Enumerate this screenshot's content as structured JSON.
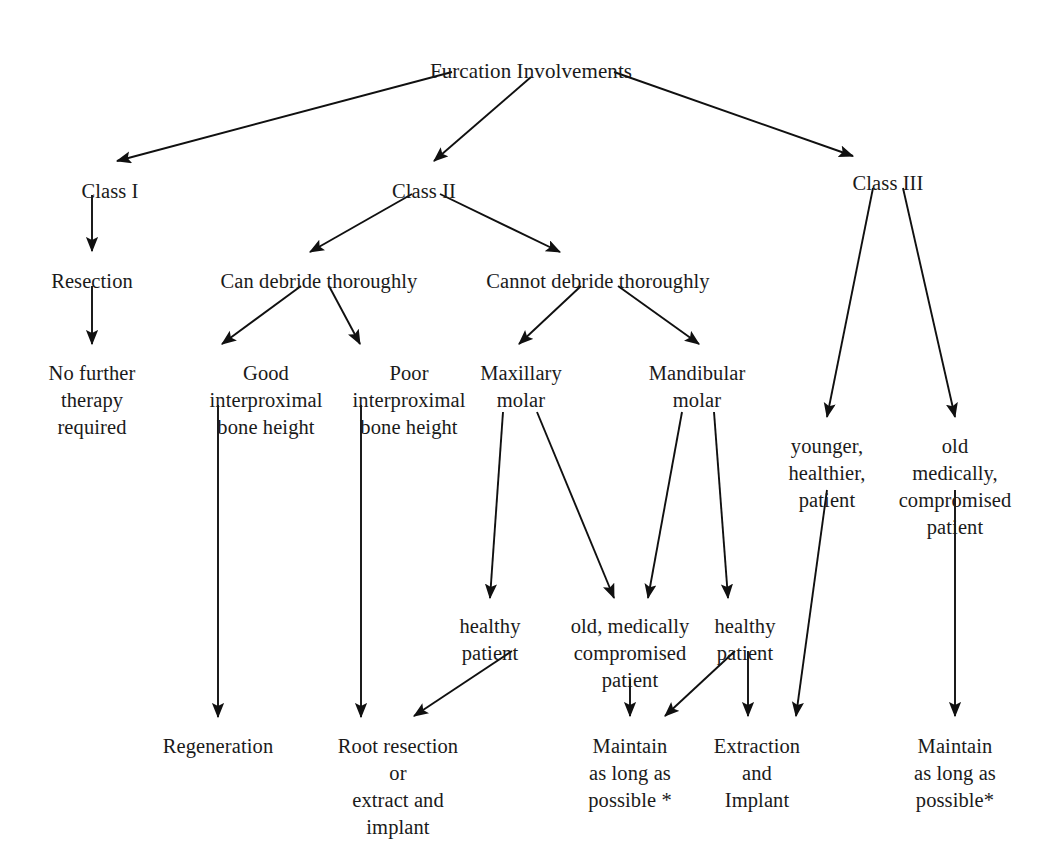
{
  "diagram": {
    "title": "Furcation Involvements",
    "type": "flowchart",
    "background_color": "#ffffff",
    "text_color": "#1a1a1a",
    "edge_color": "#101010",
    "nodes": [
      {
        "id": "root",
        "label": "Furcation Involvements",
        "x": 531,
        "y": 58,
        "level": 0
      },
      {
        "id": "class1",
        "label": "Class I",
        "x": 110,
        "y": 178,
        "level": 1
      },
      {
        "id": "class2",
        "label": "Class II",
        "x": 424,
        "y": 178,
        "level": 1
      },
      {
        "id": "class3",
        "label": "Class III",
        "x": 888,
        "y": 170,
        "level": 1
      },
      {
        "id": "resection",
        "label": "Resection",
        "x": 92,
        "y": 268,
        "level": 2
      },
      {
        "id": "can-debride",
        "label": "Can debride thoroughly",
        "x": 319,
        "y": 268,
        "level": 2
      },
      {
        "id": "cannot-debride",
        "label": "Cannot debride thoroughly",
        "x": 598,
        "y": 268,
        "level": 2
      },
      {
        "id": "no-further",
        "label": "No further\ntherapy\nrequired",
        "x": 92,
        "y": 360,
        "level": 3
      },
      {
        "id": "good-bone",
        "label": "Good\ninterproximal\nbone height",
        "x": 266,
        "y": 360,
        "level": 3
      },
      {
        "id": "poor-bone",
        "label": "Poor\ninterproximal\nbone height",
        "x": 409,
        "y": 360,
        "level": 3
      },
      {
        "id": "maxillary",
        "label": "Maxillary\nmolar",
        "x": 521,
        "y": 360,
        "level": 3
      },
      {
        "id": "mandibular",
        "label": "Mandibular\nmolar",
        "x": 697,
        "y": 360,
        "level": 3
      },
      {
        "id": "younger",
        "label": "younger,\nhealthier,\npatient",
        "x": 827,
        "y": 433,
        "level": 4
      },
      {
        "id": "old-medically",
        "label": "old medically,\ncompromised\npatient",
        "x": 955,
        "y": 433,
        "level": 4
      },
      {
        "id": "healthy-left",
        "label": "healthy\npatient",
        "x": 490,
        "y": 613,
        "level": 5
      },
      {
        "id": "old-compromised",
        "label": "old, medically\ncompromised\npatient",
        "x": 630,
        "y": 613,
        "level": 5
      },
      {
        "id": "healthy-right",
        "label": "healthy\npatient",
        "x": 745,
        "y": 613,
        "level": 5
      },
      {
        "id": "regeneration",
        "label": "Regeneration",
        "x": 218,
        "y": 733,
        "level": 6
      },
      {
        "id": "root-resection",
        "label": "Root resection\nor\nextract and\nimplant",
        "x": 398,
        "y": 733,
        "level": 6
      },
      {
        "id": "maintain-mid",
        "label": "Maintain\nas long as\npossible *",
        "x": 630,
        "y": 733,
        "level": 6
      },
      {
        "id": "extraction",
        "label": "Extraction\nand\nImplant",
        "x": 757,
        "y": 733,
        "level": 6
      },
      {
        "id": "maintain-right",
        "label": "Maintain\nas long as\npossible*",
        "x": 955,
        "y": 733,
        "level": 6
      }
    ],
    "edges": [
      {
        "from": "root",
        "to": "class1",
        "x1": 452,
        "y1": 72,
        "x2": 117,
        "y2": 161
      },
      {
        "from": "root",
        "to": "class2",
        "x1": 531,
        "y1": 77,
        "x2": 434,
        "y2": 161
      },
      {
        "from": "root",
        "to": "class3",
        "x1": 614,
        "y1": 72,
        "x2": 853,
        "y2": 156
      },
      {
        "from": "class1",
        "to": "resection",
        "x1": 92,
        "y1": 195,
        "x2": 92,
        "y2": 251
      },
      {
        "from": "class2",
        "to": "can-debride",
        "x1": 412,
        "y1": 194,
        "x2": 310,
        "y2": 252
      },
      {
        "from": "class2",
        "to": "cannot-debride",
        "x1": 440,
        "y1": 194,
        "x2": 560,
        "y2": 252
      },
      {
        "from": "resection",
        "to": "no-further",
        "x1": 92,
        "y1": 286,
        "x2": 92,
        "y2": 344
      },
      {
        "from": "can-debride",
        "to": "good-bone",
        "x1": 301,
        "y1": 286,
        "x2": 222,
        "y2": 344
      },
      {
        "from": "can-debride",
        "to": "poor-bone",
        "x1": 329,
        "y1": 286,
        "x2": 360,
        "y2": 344
      },
      {
        "from": "cannot-debride",
        "to": "maxillary",
        "x1": 581,
        "y1": 286,
        "x2": 519,
        "y2": 344
      },
      {
        "from": "cannot-debride",
        "to": "mandibular",
        "x1": 618,
        "y1": 286,
        "x2": 699,
        "y2": 344
      },
      {
        "from": "class3",
        "to": "younger",
        "x1": 873,
        "y1": 188,
        "x2": 827,
        "y2": 417
      },
      {
        "from": "class3",
        "to": "old-medically",
        "x1": 903,
        "y1": 188,
        "x2": 955,
        "y2": 417
      },
      {
        "from": "good-bone",
        "to": "regeneration",
        "x1": 218,
        "y1": 405,
        "x2": 218,
        "y2": 717
      },
      {
        "from": "poor-bone",
        "to": "root-resection",
        "x1": 361,
        "y1": 405,
        "x2": 361,
        "y2": 717
      },
      {
        "from": "maxillary",
        "to": "healthy-left",
        "x1": 503,
        "y1": 412,
        "x2": 490,
        "y2": 598
      },
      {
        "from": "maxillary",
        "to": "old-compromised",
        "x1": 537,
        "y1": 412,
        "x2": 614,
        "y2": 598
      },
      {
        "from": "mandibular",
        "to": "old-compromised",
        "x1": 682,
        "y1": 412,
        "x2": 648,
        "y2": 598
      },
      {
        "from": "mandibular",
        "to": "healthy-right",
        "x1": 714,
        "y1": 412,
        "x2": 728,
        "y2": 598
      },
      {
        "from": "healthy-left",
        "to": "root-resection",
        "x1": 512,
        "y1": 651,
        "x2": 414,
        "y2": 716
      },
      {
        "from": "old-compromised",
        "to": "maintain-mid",
        "x1": 630,
        "y1": 679,
        "x2": 630,
        "y2": 716
      },
      {
        "from": "healthy-right",
        "to": "maintain-mid",
        "x1": 735,
        "y1": 651,
        "x2": 665,
        "y2": 716
      },
      {
        "from": "healthy-right",
        "to": "extraction",
        "x1": 748,
        "y1": 651,
        "x2": 748,
        "y2": 716
      },
      {
        "from": "younger",
        "to": "extraction",
        "x1": 827,
        "y1": 490,
        "x2": 796,
        "y2": 716
      },
      {
        "from": "old-medically",
        "to": "maintain-right",
        "x1": 955,
        "y1": 490,
        "x2": 955,
        "y2": 716
      }
    ]
  }
}
